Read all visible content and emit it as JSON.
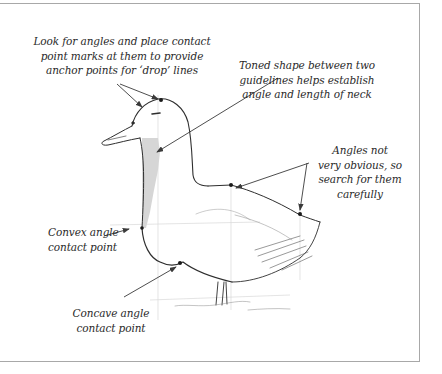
{
  "figure": {
    "annotations": [
      {
        "id": "look-for-angles",
        "lines": [
          "Look for angles and place contact",
          "point marks at them to provide",
          "anchor points for ‘drop’ lines"
        ]
      },
      {
        "id": "toned-shape",
        "lines": [
          "Toned shape between two",
          "guidelines helps establish",
          "angle and length of neck"
        ]
      },
      {
        "id": "angles-not-obvious",
        "lines": [
          "Angles not",
          "very obvious, so",
          "search for them",
          "carefully"
        ]
      },
      {
        "id": "convex-angle",
        "lines": [
          "Convex angle",
          "contact point"
        ]
      },
      {
        "id": "concave-angle",
        "lines": [
          "Concave angle",
          "contact point"
        ]
      }
    ],
    "colors": {
      "frame": "#a8a8a8",
      "ink": "#2a2a2a",
      "tone": "#c8c8c8"
    }
  }
}
